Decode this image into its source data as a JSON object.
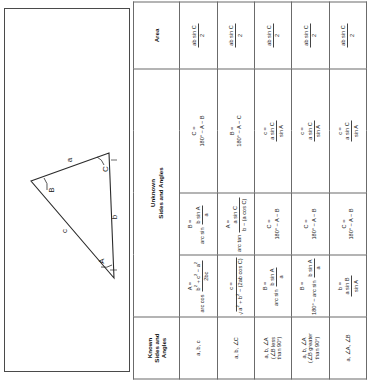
{
  "document": {
    "title": "Triangle Solution Table"
  },
  "diagram": {
    "name": "oblique-triangle-diagram",
    "vertex_labels": [
      "A",
      "B",
      "C"
    ],
    "side_labels": [
      "a",
      "b",
      "c"
    ],
    "label_A": "A",
    "label_B": "B",
    "label_C": "C",
    "side_a": "a",
    "side_b": "b",
    "side_c": "c"
  },
  "table": {
    "headers": {
      "known": "Known\nSides and\nAngles",
      "known_line1": "Known",
      "known_line2": "Sides and",
      "known_line3": "Angles",
      "unknown": "Unknown\nSides and Angles",
      "unknown_line1": "Unknown",
      "unknown_line2": "Sides and Angles",
      "area": "Area"
    },
    "rows": [
      {
        "known": "a, b, c",
        "known_sub": "",
        "u1_lhs": "A =",
        "u1_num": "b² + c² − a²",
        "u1_den": "2bc",
        "u1_prefix": "arc cos",
        "u2_lhs": "B =",
        "u2_prefix": "arc sin",
        "u2_num": "b sin A",
        "u2_den": "a",
        "u3_lhs": "C =",
        "u3_expr": "180° − A − B",
        "u4_expr": "",
        "area_num": "ab sin C",
        "area_den": "2"
      },
      {
        "known": "a, b, ∠C",
        "known_sub": "",
        "u1_lhs": "c =",
        "u1_radicand": "a² + b² − (2ab cos C)",
        "u2_lhs": "A =",
        "u2_prefix": "arc tan",
        "u2_num": "a sin C",
        "u2_den": "b − (a cos C)",
        "u3_lhs": "B =",
        "u3_expr": "180° − A − C",
        "u4_expr": "",
        "area_num": "ab sin C",
        "area_den": "2"
      },
      {
        "known": "a, b, ∠A",
        "known_sub": "(∠B less\nthan 90°)",
        "known_sub1": "(∠B less",
        "known_sub2": "than 90°)",
        "u1_lhs": "B =",
        "u1_prefix": "arc sin",
        "u1_num": "b sin A",
        "u1_den": "a",
        "u2_lhs": "C =",
        "u2_expr": "180° − A − B",
        "u3_lhs": "c =",
        "u3_num": "a sin C",
        "u3_den": "sin A",
        "area_num": "ab sin C",
        "area_den": "2"
      },
      {
        "known": "a, b, ∠A",
        "known_sub": "(∠B greater\nthan 90°)",
        "known_sub1": "(∠B greater",
        "known_sub2": "than 90°)",
        "u1_lhs": "B =",
        "u1_prefix": "180° −",
        "u1_prefix2": "arc sin",
        "u1_num": "b sin A",
        "u1_den": "a",
        "u2_lhs": "C =",
        "u2_expr": "180° − A − B",
        "u3_lhs": "c =",
        "u3_num": "a sin C",
        "u3_den": "sin A",
        "area_num": "ab sin C",
        "area_den": "2"
      },
      {
        "known": "a, ∠A, ∠B",
        "known_sub": "",
        "u1_lhs": "b =",
        "u1_num": "a sin B",
        "u1_den": "sin A",
        "u2_lhs": "C =",
        "u2_expr": "180° − A − B",
        "u3_lhs": "c =",
        "u3_num": "a sin C",
        "u3_den": "sin A",
        "area_num": "ab sin C",
        "area_den": "2"
      }
    ]
  }
}
